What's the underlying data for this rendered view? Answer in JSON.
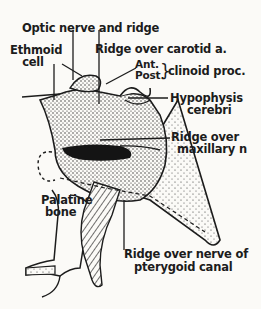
{
  "figure": {
    "labels": {
      "optic_nerve": "Optic nerve and ridge",
      "ethmoid_cell_line1": "Ethmoid",
      "ethmoid_cell_line2": "cell",
      "ridge_carotid": "Ridge over carotid a.",
      "ant": "Ant.",
      "post": "Post.",
      "clinoid": "clinoid proc.",
      "hypophysis_line1": "Hypophysis",
      "hypophysis_line2": "cerebri",
      "ridge_maxillary_line1": "Ridge over",
      "ridge_maxillary_line2": "maxillary n",
      "palatine_line1": "Palatine",
      "palatine_line2": "bone",
      "pterygoid_line1": "Ridge over nerve of",
      "pterygoid_line2": "pterygoid canal"
    },
    "colors": {
      "ink": "#1c1c1c",
      "paper": "#fbfaf7"
    }
  }
}
